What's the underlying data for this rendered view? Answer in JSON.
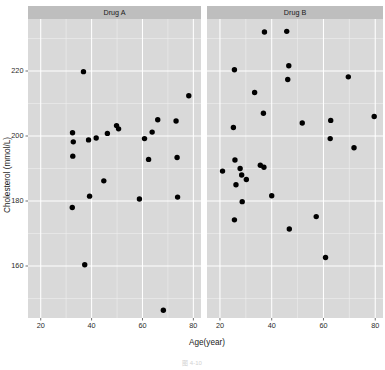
{
  "figure": {
    "caption": "图 4-10",
    "background": "#ffffff",
    "panel_fill": "#d9d9d9",
    "strip_fill": "#bebebe",
    "grid_major_color": "#ffffff",
    "grid_minor_color": "#f0f0f0",
    "point_color": "#000000"
  },
  "axes": {
    "x": {
      "title": "Age(year)",
      "ticks": [
        20,
        40,
        60,
        80
      ],
      "tick_labels": [
        "20",
        "40",
        "60",
        "80"
      ],
      "lim": [
        15,
        83
      ],
      "minor_ticks": [
        30,
        50,
        70
      ]
    },
    "y": {
      "title": "Cholesterol (mmol/L)",
      "ticks": [
        160,
        180,
        200,
        220
      ],
      "tick_labels": [
        "160",
        "180",
        "200",
        "220"
      ],
      "lim": [
        144,
        236
      ],
      "minor_ticks": [
        150,
        170,
        190,
        210,
        230
      ]
    }
  },
  "chart_data": {
    "type": "scatter",
    "title": "",
    "xlabel": "Age(year)",
    "ylabel": "Cholesterol (mmol/L)",
    "xlim": [
      15,
      83
    ],
    "ylim": [
      144,
      236
    ],
    "grid": true,
    "legend": "none",
    "facet_variable": "Drug",
    "facet_labels": [
      "Drug A",
      "Drug B"
    ],
    "series": [
      {
        "name": "Drug A",
        "facet": "Drug A",
        "points": [
          {
            "x": 32.5,
            "y": 201.0
          },
          {
            "x": 32.8,
            "y": 198.2
          },
          {
            "x": 32.6,
            "y": 193.8
          },
          {
            "x": 32.4,
            "y": 178.0
          },
          {
            "x": 36.8,
            "y": 219.8
          },
          {
            "x": 37.3,
            "y": 160.4
          },
          {
            "x": 38.8,
            "y": 198.8
          },
          {
            "x": 39.2,
            "y": 181.5
          },
          {
            "x": 41.8,
            "y": 199.4
          },
          {
            "x": 44.8,
            "y": 186.2
          },
          {
            "x": 46.2,
            "y": 200.8
          },
          {
            "x": 49.8,
            "y": 203.2
          },
          {
            "x": 50.6,
            "y": 202.2
          },
          {
            "x": 58.8,
            "y": 180.6
          },
          {
            "x": 60.8,
            "y": 199.2
          },
          {
            "x": 62.4,
            "y": 192.8
          },
          {
            "x": 63.8,
            "y": 201.2
          },
          {
            "x": 66.0,
            "y": 205.0
          },
          {
            "x": 68.2,
            "y": 146.4
          },
          {
            "x": 73.2,
            "y": 204.6
          },
          {
            "x": 73.6,
            "y": 193.4
          },
          {
            "x": 73.8,
            "y": 181.2
          },
          {
            "x": 78.2,
            "y": 212.4
          }
        ]
      },
      {
        "name": "Drug B",
        "facet": "Drug B",
        "points": [
          {
            "x": 21.0,
            "y": 189.2
          },
          {
            "x": 25.6,
            "y": 220.4
          },
          {
            "x": 25.2,
            "y": 202.6
          },
          {
            "x": 25.8,
            "y": 192.6
          },
          {
            "x": 26.2,
            "y": 185.0
          },
          {
            "x": 25.6,
            "y": 174.2
          },
          {
            "x": 27.8,
            "y": 190.0
          },
          {
            "x": 28.4,
            "y": 188.0
          },
          {
            "x": 28.6,
            "y": 179.8
          },
          {
            "x": 30.2,
            "y": 186.6
          },
          {
            "x": 33.4,
            "y": 213.4
          },
          {
            "x": 35.6,
            "y": 191.0
          },
          {
            "x": 36.8,
            "y": 207.0
          },
          {
            "x": 37.0,
            "y": 190.4
          },
          {
            "x": 37.2,
            "y": 232.0
          },
          {
            "x": 40.0,
            "y": 181.6
          },
          {
            "x": 45.8,
            "y": 232.2
          },
          {
            "x": 46.6,
            "y": 221.6
          },
          {
            "x": 46.2,
            "y": 217.4
          },
          {
            "x": 46.8,
            "y": 171.4
          },
          {
            "x": 51.8,
            "y": 204.0
          },
          {
            "x": 57.2,
            "y": 175.2
          },
          {
            "x": 60.8,
            "y": 162.6
          },
          {
            "x": 62.8,
            "y": 204.8
          },
          {
            "x": 62.6,
            "y": 199.2
          },
          {
            "x": 69.6,
            "y": 218.2
          },
          {
            "x": 71.8,
            "y": 196.4
          },
          {
            "x": 79.6,
            "y": 206.0
          }
        ]
      }
    ]
  }
}
